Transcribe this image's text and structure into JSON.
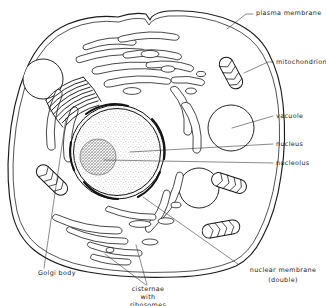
{
  "figure": {
    "style": "hand-drawn line diagram, stippled shading",
    "background_color": "#ffffff",
    "ink_color": "#1a1a1a"
  },
  "labels": [
    {
      "id": "plasma-membrane",
      "text": "plasma membrane",
      "lines": [
        "plasma membrane"
      ],
      "position": "top-right",
      "align": "start"
    },
    {
      "id": "mitochondrion",
      "text": "mitochondrion",
      "lines": [
        "mitochondrion"
      ],
      "position": "right-upper",
      "align": "start"
    },
    {
      "id": "vacuole",
      "text": "vacuole",
      "lines": [
        "vacuole"
      ],
      "position": "right-middle",
      "align": "start"
    },
    {
      "id": "nucleus",
      "text": "nucleus",
      "lines": [
        "nucleus"
      ],
      "position": "right-middle",
      "align": "start"
    },
    {
      "id": "nucleolus",
      "text": "nucleolus",
      "lines": [
        "nucleolus"
      ],
      "position": "right-middle",
      "align": "start"
    },
    {
      "id": "nuclear-membrane",
      "text": "nuclear membrane (double)",
      "lines": [
        "nuclear membrane",
        "(double)"
      ],
      "position": "bottom-right",
      "align": "middle"
    },
    {
      "id": "golgi-body",
      "text": "Golgi body",
      "lines": [
        "Golgi body"
      ],
      "position": "bottom-left",
      "align": "start"
    },
    {
      "id": "cisternae-ribosomes",
      "text": "cisternae with ribosomes",
      "lines": [
        "cisternae",
        "with",
        "ribosomes"
      ],
      "position": "bottom-center",
      "align": "middle"
    }
  ],
  "label_text": {
    "plasma_membrane": "plasma membrane",
    "mitochondrion": "mitochondrion",
    "vacuole": "vacuole",
    "nucleus": "nucleus",
    "nucleolus": "nucleolus",
    "nuclear_membrane_l1": "nuclear membrane",
    "nuclear_membrane_l2": "(double)",
    "golgi_body": "Golgi body",
    "cisternae_l1": "cisternae",
    "cisternae_l2": "with",
    "cisternae_l3": "ribosomes"
  },
  "structures": {
    "cell": {
      "name": "cell outline",
      "membrane": "double line"
    },
    "nucleus": {
      "name": "nucleus",
      "shading": "fine stipple",
      "membrane": "double"
    },
    "nucleolus": {
      "name": "nucleolus",
      "shading": "dense dark stipple"
    },
    "vacuoles": {
      "count": 3,
      "appearance": "plain white circles"
    },
    "mitochondria": {
      "count": 4,
      "appearance": "capsule with internal cristae"
    },
    "golgi_body": {
      "name": "Golgi body",
      "appearance": "stack of curved flattened sacs"
    },
    "cisternae": {
      "name": "cisternae with ribosomes",
      "appearance": "elongated double-walled sacs studded with ribosome dots"
    }
  }
}
